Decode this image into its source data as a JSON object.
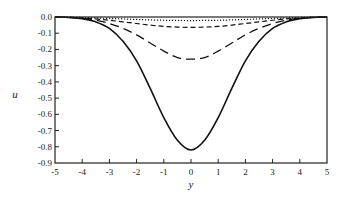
{
  "chart_data": {
    "type": "line",
    "title": "",
    "xlabel": "y",
    "ylabel": "u",
    "xlim": [
      -5,
      5
    ],
    "ylim": [
      -0.9,
      0.0
    ],
    "xticks": [
      -5,
      -4,
      -3,
      -2,
      -1,
      0,
      1,
      2,
      3,
      4,
      5
    ],
    "xtick_labels": [
      "-5",
      "-4",
      "-3",
      "-2",
      "-1",
      "0",
      "1",
      "2",
      "3",
      "4",
      "5"
    ],
    "yticks": [
      0.0,
      -0.1,
      -0.2,
      -0.3,
      -0.4,
      -0.5,
      -0.6,
      -0.7,
      -0.8,
      -0.9
    ],
    "ytick_labels": [
      "0.0",
      "-0.1",
      "-0.2",
      "-0.3",
      "-0.4",
      "-0.5",
      "-0.6",
      "-0.7",
      "-0.8",
      "-0.9"
    ],
    "grid": false,
    "legend": null,
    "x": [
      -5,
      -4.5,
      -4,
      -3.5,
      -3,
      -2.5,
      -2,
      -1.5,
      -1,
      -0.5,
      0,
      0.5,
      1,
      1.5,
      2,
      2.5,
      3,
      3.5,
      4,
      4.5,
      5
    ],
    "series": [
      {
        "name": "solid",
        "style": "solid",
        "values": [
          0.0,
          -0.003,
          -0.01,
          -0.03,
          -0.07,
          -0.15,
          -0.27,
          -0.44,
          -0.62,
          -0.76,
          -0.82,
          -0.76,
          -0.62,
          -0.44,
          -0.27,
          -0.15,
          -0.07,
          -0.03,
          -0.01,
          -0.003,
          0.0
        ]
      },
      {
        "name": "long-dash",
        "style": "long-dash",
        "values": [
          0.0,
          -0.002,
          -0.008,
          -0.02,
          -0.04,
          -0.07,
          -0.11,
          -0.16,
          -0.21,
          -0.25,
          -0.26,
          -0.25,
          -0.21,
          -0.16,
          -0.11,
          -0.07,
          -0.04,
          -0.02,
          -0.008,
          -0.002,
          0.0
        ]
      },
      {
        "name": "medium-dash",
        "style": "medium-dash",
        "values": [
          0.0,
          -0.002,
          -0.006,
          -0.012,
          -0.02,
          -0.03,
          -0.04,
          -0.05,
          -0.058,
          -0.062,
          -0.064,
          -0.062,
          -0.058,
          -0.05,
          -0.04,
          -0.03,
          -0.02,
          -0.012,
          -0.006,
          -0.002,
          0.0
        ]
      },
      {
        "name": "dotted",
        "style": "dotted",
        "values": [
          0.0,
          -0.001,
          -0.003,
          -0.006,
          -0.009,
          -0.012,
          -0.015,
          -0.018,
          -0.02,
          -0.021,
          -0.022,
          -0.021,
          -0.02,
          -0.018,
          -0.015,
          -0.012,
          -0.009,
          -0.006,
          -0.003,
          -0.001,
          0.0
        ]
      }
    ]
  }
}
